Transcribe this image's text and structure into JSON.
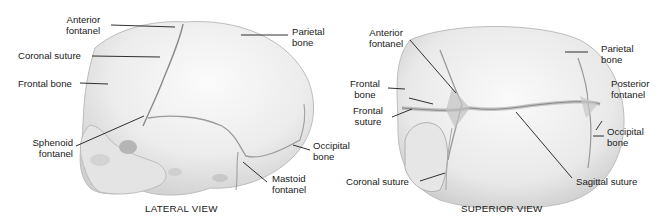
{
  "lateral": {
    "caption": "LATERAL VIEW",
    "labels": {
      "anterior_fontanel": [
        "Anterior",
        "fontanel"
      ],
      "parietal_bone": [
        "Parietal",
        "bone"
      ],
      "coronal_suture": [
        "Coronal suture"
      ],
      "frontal_bone": [
        "Frontal bone"
      ],
      "sphenoid_fontanel": [
        "Sphenoid",
        "fontanel"
      ],
      "occipital_bone": [
        "Occipital",
        "bone"
      ],
      "mastoid_fontanel": [
        "Mastoid",
        "fontanel"
      ]
    }
  },
  "superior": {
    "caption": "SUPERIOR VIEW",
    "labels": {
      "anterior_fontanel": [
        "Anterior",
        "fontanel"
      ],
      "parietal_bone": [
        "Parietal",
        "bone"
      ],
      "frontal_bone": [
        "Frontal",
        "bone"
      ],
      "posterior_fontanel": [
        "Posterior",
        "fontanel"
      ],
      "frontal_suture": [
        "Frontal",
        "suture"
      ],
      "occipital_bone": [
        "Occipital",
        "bone"
      ],
      "coronal_suture": [
        "Coronal suture"
      ],
      "sagittal_suture": [
        "Sagittal suture"
      ]
    }
  },
  "colors": {
    "background": "#ffffff",
    "bone": "#ececec",
    "bone_shadow": "#c9c9c9",
    "suture": "#8a8a8a",
    "leader": "#1a1a1a"
  }
}
